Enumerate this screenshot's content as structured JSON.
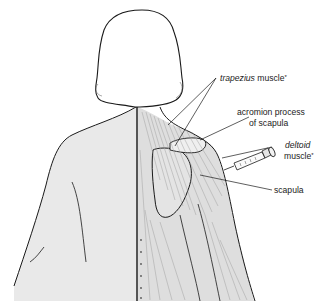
{
  "diagram": {
    "labels": {
      "trapezius": {
        "italic": "trapezius",
        "rest": " muscle",
        "mark": "*"
      },
      "acromion_line1": "acromion process",
      "acromion_line2": "of scapula",
      "deltoid_line1": "deltoid",
      "deltoid_line2": "muscle",
      "deltoid_mark": "*",
      "scapula": "scapula"
    },
    "colors": {
      "outline": "#1a1a1a",
      "skin": "#e9e9e9",
      "muscle": "#dedede",
      "background": "#ffffff",
      "text": "#222222"
    }
  }
}
